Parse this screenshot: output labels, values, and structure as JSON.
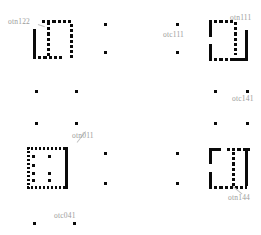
{
  "figure": {
    "background_color": "#ffffff",
    "mark_color": "#0a0a0a",
    "label_color": "#9b9b9b",
    "width": 261,
    "height": 235
  },
  "labels": [
    {
      "id": "otn122",
      "text": "otn122",
      "x": 8,
      "y": 18,
      "leader": true
    },
    {
      "id": "otc111",
      "text": "otc111",
      "x": 163,
      "y": 31,
      "leader": false
    },
    {
      "id": "otn111",
      "text": "otn111",
      "x": 230,
      "y": 14,
      "leader": false
    },
    {
      "id": "otc141",
      "text": "otc141",
      "x": 232,
      "y": 95,
      "leader": false
    },
    {
      "id": "otn011",
      "text": "otn011",
      "x": 72,
      "y": 132,
      "leader": true
    },
    {
      "id": "otn144",
      "text": "otn144",
      "x": 228,
      "y": 194,
      "leader": true
    },
    {
      "id": "otc041",
      "text": "otc041",
      "x": 54,
      "y": 212,
      "leader": false
    }
  ],
  "glyphs": [
    {
      "id": "glyph-otn122",
      "label_ref": "otn122",
      "x": 33,
      "y": 20,
      "w": 40,
      "h": 39,
      "description": "broken-square with interior vertical dashed stroke"
    },
    {
      "id": "glyph-otn111",
      "label_ref": "otn111",
      "x": 209,
      "y": 20,
      "w": 41,
      "h": 41,
      "description": "broken-square with interior vertical dashed stroke"
    },
    {
      "id": "glyph-otn011",
      "label_ref": "otn011",
      "x": 27,
      "y": 147,
      "w": 43,
      "h": 42,
      "description": "dotted-square with interior dot matrix and solid right edge"
    },
    {
      "id": "glyph-otn144",
      "label_ref": "otn144",
      "x": 209,
      "y": 148,
      "w": 41,
      "h": 41,
      "description": "broken-square with interior vertical dashed stroke"
    }
  ],
  "dots": [
    {
      "x": 104,
      "y": 23
    },
    {
      "x": 104,
      "y": 51
    },
    {
      "x": 176,
      "y": 23
    },
    {
      "x": 176,
      "y": 51
    },
    {
      "x": 35,
      "y": 90
    },
    {
      "x": 75,
      "y": 90
    },
    {
      "x": 35,
      "y": 122
    },
    {
      "x": 75,
      "y": 122
    },
    {
      "x": 214,
      "y": 90
    },
    {
      "x": 246,
      "y": 90
    },
    {
      "x": 214,
      "y": 122
    },
    {
      "x": 246,
      "y": 122
    },
    {
      "x": 104,
      "y": 152
    },
    {
      "x": 104,
      "y": 182
    },
    {
      "x": 176,
      "y": 152
    },
    {
      "x": 176,
      "y": 182
    },
    {
      "x": 33,
      "y": 222
    },
    {
      "x": 73,
      "y": 222
    }
  ],
  "interior_dots": {
    "glyph_otn011": [
      {
        "x": 5,
        "y": 8
      },
      {
        "x": 21,
        "y": 8
      },
      {
        "x": 5,
        "y": 17
      },
      {
        "x": 5,
        "y": 25
      },
      {
        "x": 21,
        "y": 25
      },
      {
        "x": 5,
        "y": 33
      },
      {
        "x": 21,
        "y": 33
      }
    ]
  }
}
